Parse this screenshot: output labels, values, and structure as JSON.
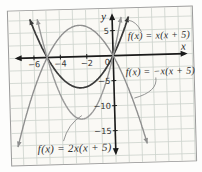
{
  "figure": {
    "axis_labels": {
      "x": "x",
      "y": "y"
    },
    "equations": [
      {
        "label": "f(x) = x(x + 5)"
      },
      {
        "label": "f(x) = −x(x + 5)"
      },
      {
        "label": "f(x) = 2x(x + 5)"
      }
    ]
  },
  "chart_data": {
    "type": "line",
    "xlabel": "x",
    "ylabel": "y",
    "x_grid_step": 1,
    "y_grid_step": 2.5,
    "xlim": [
      -7.5,
      6
    ],
    "ylim": [
      -21,
      9
    ],
    "grid": true,
    "legend_position": "labels-with-leader-lines",
    "x_ticks": [
      -6,
      -4,
      -2
    ],
    "x_tick_labels": [
      "−6",
      "−4",
      "−2"
    ],
    "origin_label": "0",
    "y_ticks": [
      5,
      -5,
      -10,
      -15
    ],
    "y_tick_labels": [
      "5",
      "−5",
      "−10",
      "−15"
    ],
    "series": [
      {
        "name": "f(x) = x(x + 5)",
        "a": 1,
        "b": 5,
        "c": 0,
        "roots": [
          -5,
          0
        ],
        "vertex": [
          -2.5,
          -6.25
        ],
        "color": "#3a3a3a",
        "width": 1.7
      },
      {
        "name": "f(x) = −x(x + 5)",
        "a": -1,
        "b": -5,
        "c": 0,
        "roots": [
          -5,
          0
        ],
        "vertex": [
          -2.5,
          6.25
        ],
        "color": "#8f8f8f",
        "width": 1.4
      },
      {
        "name": "f(x) = 2x(x + 5)",
        "a": 2,
        "b": 10,
        "c": 0,
        "roots": [
          -5,
          0
        ],
        "vertex": [
          -2.5,
          -12.5
        ],
        "color": "#989898",
        "width": 1.4
      }
    ],
    "colors": {
      "grid": "#ccd3cc",
      "axis": "#1b1b1b",
      "paper": "#faf9f5",
      "frame": "#9b9b9b",
      "leader": "#8a8a8a",
      "tick_text": "#333333"
    }
  }
}
